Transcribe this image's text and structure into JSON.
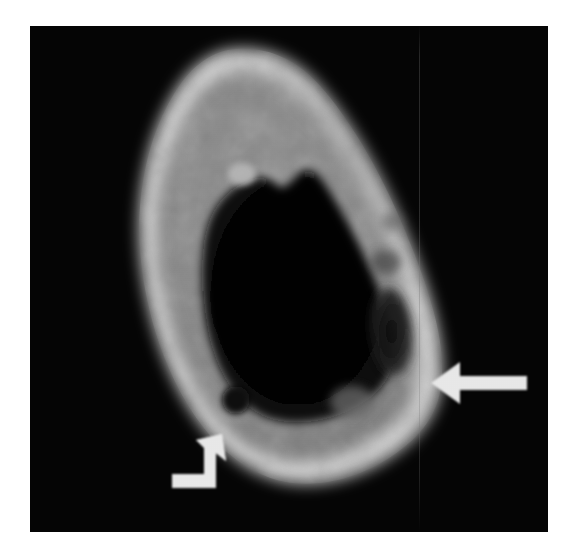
{
  "figure": {
    "type": "radiologic-image",
    "modality_appearance": "axial cross-sectional bone image (CT-like), grayscale",
    "background_color": "#ffffff",
    "panel_background_color": "#040404",
    "panel": {
      "x": 30,
      "y": 26,
      "width": 518,
      "height": 506
    },
    "caption": "",
    "label": ""
  },
  "anatomy": {
    "name": "tubular-bone-cross-section",
    "description": "Ovoid teardrop-shaped bone in cross section with bright cortical rim, gray trabecular/medullary marrow, and a large dark central medullary cavity",
    "cortex_color": "#d8d8d8",
    "trabecular_color": "#8e8e8e",
    "medullary_cavity_color": "#050505",
    "lesion_color": "#1a1a1a",
    "outer_contour_note": "apex superior, broad base inferior, widest in lower third",
    "features": [
      {
        "id": "lateral-cortical-lucency",
        "label": "lucent destructive focus in lateral cortex",
        "marker": "straight-arrow",
        "position": {
          "x": 400,
          "y": 325
        }
      },
      {
        "id": "medial-round-lucency",
        "label": "small round lucent focus in inferomedial cortex",
        "marker": "curved-arrow",
        "position": {
          "x": 236,
          "y": 400
        }
      },
      {
        "id": "endosteal-spur",
        "label": "small bright endosteal nodule at superior margin of cavity",
        "marker": "none",
        "position": {
          "x": 241,
          "y": 174
        }
      },
      {
        "id": "inferior-gray-patch",
        "label": "ill-defined gray patch in inferior cortex",
        "marker": "none",
        "position": {
          "x": 352,
          "y": 402
        }
      }
    ]
  },
  "annotations": {
    "straight_arrow": {
      "name": "straight-arrow",
      "direction": "points left",
      "color": "#e9e9e9",
      "tip": {
        "x": 460,
        "y": 361
      },
      "tail": {
        "x": 527,
        "y": 361
      },
      "points_to": "lateral-cortical-lucency"
    },
    "curved_arrow": {
      "name": "curved-arrow",
      "direction": "hooked, points up and to the right",
      "color": "#e9e9e9",
      "tip": {
        "x": 216,
        "y": 430
      },
      "tail": {
        "x": 172,
        "y": 473
      },
      "points_to": "medial-round-lucency"
    }
  },
  "artifacts": {
    "vertical_scanline": {
      "name": "vertical-scanline-artifact",
      "x": 419,
      "color": "#787878"
    }
  }
}
